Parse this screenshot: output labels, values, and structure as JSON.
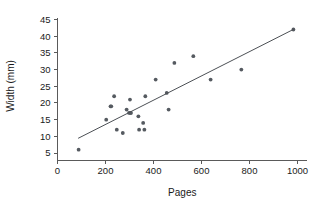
{
  "chart_data": {
    "type": "scatter",
    "title": "",
    "xlabel": "Pages",
    "ylabel": "Width (mm)",
    "xlim": [
      0,
      1040
    ],
    "ylim": [
      3,
      46
    ],
    "xticks": [
      0,
      200,
      400,
      600,
      800,
      1000
    ],
    "yticks": [
      5,
      10,
      15,
      20,
      25,
      30,
      35,
      40,
      45
    ],
    "grid": false,
    "legend": false,
    "point_color": "#555a60",
    "line_color": "#4c5055",
    "axis_color": "#5a5a5a",
    "points": [
      {
        "x": 88,
        "y": 6
      },
      {
        "x": 203,
        "y": 15
      },
      {
        "x": 221,
        "y": 19
      },
      {
        "x": 224,
        "y": 19
      },
      {
        "x": 236,
        "y": 22
      },
      {
        "x": 247,
        "y": 12
      },
      {
        "x": 272,
        "y": 11
      },
      {
        "x": 288,
        "y": 18
      },
      {
        "x": 298,
        "y": 17
      },
      {
        "x": 302,
        "y": 21
      },
      {
        "x": 304,
        "y": 17
      },
      {
        "x": 306,
        "y": 17
      },
      {
        "x": 337,
        "y": 16
      },
      {
        "x": 340,
        "y": 12
      },
      {
        "x": 357,
        "y": 14
      },
      {
        "x": 362,
        "y": 12
      },
      {
        "x": 366,
        "y": 22
      },
      {
        "x": 409,
        "y": 27
      },
      {
        "x": 455,
        "y": 23
      },
      {
        "x": 463,
        "y": 18
      },
      {
        "x": 487,
        "y": 32
      },
      {
        "x": 566,
        "y": 34
      },
      {
        "x": 638,
        "y": 27
      },
      {
        "x": 766,
        "y": 30
      },
      {
        "x": 983,
        "y": 42
      }
    ],
    "trend_line": {
      "x_start": 86,
      "y_start": 9.4,
      "x_end": 985,
      "y_end": 42.1
    }
  }
}
